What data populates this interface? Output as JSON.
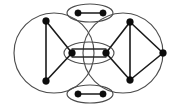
{
  "figure": {
    "kind": "graph-diagram",
    "background_color": "#ffffff",
    "node_color": "#0d0d0d",
    "edge_color": "#1a1a1a",
    "hull_color": "#4d4d4d",
    "title": "",
    "caption": ""
  },
  "groups": [
    {
      "id": "group-left-circle",
      "shape": "circle",
      "cx": 54,
      "cy": 53,
      "r": 40,
      "label": ""
    },
    {
      "id": "group-center-ellipse",
      "shape": "ellipse",
      "cx": 89,
      "cy": 53,
      "rx": 25,
      "ry": 11,
      "label": ""
    },
    {
      "id": "group-right-circle",
      "shape": "circle",
      "cx": 123,
      "cy": 53,
      "r": 40,
      "label": ""
    },
    {
      "id": "group-top-ellipse",
      "shape": "ellipse",
      "cx": 90,
      "cy": 13,
      "rx": 23,
      "ry": 9,
      "label": ""
    },
    {
      "id": "group-bottom-ellipse",
      "shape": "ellipse",
      "cx": 90,
      "cy": 94,
      "rx": 23,
      "ry": 9,
      "label": ""
    }
  ],
  "nodes": [
    {
      "id": "n-left-top",
      "cx": 46,
      "cy": 21,
      "r": 3.4,
      "group": "group-left-circle",
      "label": ""
    },
    {
      "id": "n-left-bottom",
      "cx": 46,
      "cy": 81,
      "r": 3.4,
      "group": "group-left-circle",
      "label": ""
    },
    {
      "id": "n-center-left",
      "cx": 72,
      "cy": 53,
      "r": 3.4,
      "group": "group-center-ellipse",
      "label": ""
    },
    {
      "id": "n-center-right",
      "cx": 106,
      "cy": 53,
      "r": 3.4,
      "group": "group-center-ellipse",
      "label": ""
    },
    {
      "id": "n-right-top",
      "cx": 130,
      "cy": 22,
      "r": 3.4,
      "group": "group-right-circle",
      "label": ""
    },
    {
      "id": "n-right-bottom",
      "cx": 130,
      "cy": 80,
      "r": 3.4,
      "group": "group-right-circle",
      "label": ""
    },
    {
      "id": "n-right-far",
      "cx": 163,
      "cy": 53,
      "r": 3.4,
      "group": "group-right-circle",
      "label": ""
    },
    {
      "id": "n-top-left",
      "cx": 78,
      "cy": 13,
      "r": 3.2,
      "group": "group-top-ellipse",
      "label": ""
    },
    {
      "id": "n-top-right",
      "cx": 103,
      "cy": 13,
      "r": 3.2,
      "group": "group-top-ellipse",
      "label": ""
    },
    {
      "id": "n-bottom-left",
      "cx": 78,
      "cy": 94,
      "r": 3.2,
      "group": "group-bottom-ellipse",
      "label": ""
    },
    {
      "id": "n-bottom-right",
      "cx": 103,
      "cy": 94,
      "r": 3.2,
      "group": "group-bottom-ellipse",
      "label": ""
    }
  ],
  "edges": [
    {
      "id": "e-left-vertical",
      "x1": 46,
      "y1": 21,
      "x2": 46,
      "y2": 81,
      "style": "single"
    },
    {
      "id": "e-left-top-center",
      "x1": 46,
      "y1": 21,
      "x2": 72,
      "y2": 53,
      "style": "single"
    },
    {
      "id": "e-left-bot-center",
      "x1": 46,
      "y1": 81,
      "x2": 72,
      "y2": 53,
      "style": "single"
    },
    {
      "id": "e-center-upper",
      "x1": 72,
      "y1": 49,
      "x2": 106,
      "y2": 49,
      "style": "parallel-upper"
    },
    {
      "id": "e-center-lower",
      "x1": 72,
      "y1": 57,
      "x2": 106,
      "y2": 57,
      "style": "parallel-lower"
    },
    {
      "id": "e-center-right-top",
      "x1": 106,
      "y1": 53,
      "x2": 130,
      "y2": 22,
      "style": "single"
    },
    {
      "id": "e-center-right-bot",
      "x1": 106,
      "y1": 53,
      "x2": 130,
      "y2": 80,
      "style": "single"
    },
    {
      "id": "e-right-vertical",
      "x1": 130,
      "y1": 22,
      "x2": 130,
      "y2": 80,
      "style": "single"
    },
    {
      "id": "e-right-top-far",
      "x1": 130,
      "y1": 22,
      "x2": 163,
      "y2": 53,
      "style": "single"
    },
    {
      "id": "e-right-bot-far",
      "x1": 130,
      "y1": 80,
      "x2": 163,
      "y2": 53,
      "style": "single"
    },
    {
      "id": "e-top-pair",
      "x1": 78,
      "y1": 13,
      "x2": 103,
      "y2": 13,
      "style": "single"
    },
    {
      "id": "e-bottom-pair",
      "x1": 78,
      "y1": 94,
      "x2": 103,
      "y2": 94,
      "style": "single"
    }
  ]
}
